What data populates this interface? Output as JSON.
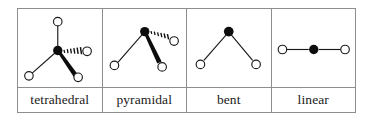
{
  "figure": {
    "type": "molecular-geometry-table",
    "columns": 4,
    "rows": [
      "diagrams",
      "labels"
    ],
    "border_color": "#8d8d8d",
    "background": "#ffffff",
    "atom_center_color": "#000000",
    "atom_outer_fill": "#ffffff",
    "atom_outer_stroke": "#1a1a1a",
    "bond_color": "#1a1a1a"
  },
  "cells": [
    {
      "key": "tetrahedral",
      "label": "tetrahedral",
      "central_atom": {
        "x": 56,
        "y": 49,
        "r": 4.6,
        "style": "filled"
      },
      "outer_atoms": [
        {
          "x": 56,
          "y": 19,
          "r": 4.3,
          "bond": "plain"
        },
        {
          "x": 85,
          "y": 50,
          "r": 4.3,
          "bond": "hashed-wedge"
        },
        {
          "x": 28,
          "y": 73,
          "r": 4.3,
          "bond": "plain"
        },
        {
          "x": 75,
          "y": 75,
          "r": 4.3,
          "bond": "solid-wedge"
        }
      ],
      "bond_count": 4
    },
    {
      "key": "pyramidal",
      "label": "pyramidal",
      "central_atom": {
        "x": 143,
        "y": 29,
        "r": 4.6,
        "style": "filled"
      },
      "outer_atoms": [
        {
          "x": 114,
          "y": 62,
          "r": 4.3,
          "bond": "plain"
        },
        {
          "x": 178,
          "y": 38,
          "r": 4.3,
          "bond": "hashed-wedge"
        },
        {
          "x": 166,
          "y": 66,
          "r": 4.3,
          "bond": "solid-wedge"
        }
      ],
      "bond_count": 3
    },
    {
      "key": "bent",
      "label": "bent",
      "central_atom": {
        "x": 229,
        "y": 30,
        "r": 4.6,
        "style": "filled"
      },
      "outer_atoms": [
        {
          "x": 201,
          "y": 63,
          "r": 4.3,
          "bond": "plain"
        },
        {
          "x": 258,
          "y": 63,
          "r": 4.3,
          "bond": "plain"
        }
      ],
      "bond_count": 2
    },
    {
      "key": "linear",
      "label": "linear",
      "central_atom": {
        "x": 315,
        "y": 48,
        "r": 4.6,
        "style": "filled"
      },
      "outer_atoms": [
        {
          "x": 283,
          "y": 48,
          "r": 4.3,
          "bond": "plain"
        },
        {
          "x": 347,
          "y": 48,
          "r": 4.3,
          "bond": "plain"
        }
      ],
      "bond_count": 2
    }
  ],
  "labels": {
    "tetrahedral": "tetrahedral",
    "pyramidal": "pyramidal",
    "bent": "bent",
    "linear": "linear"
  }
}
